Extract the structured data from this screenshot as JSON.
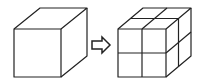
{
  "diagram": {
    "left": {
      "label": "single-cube"
    },
    "arrow": {
      "label": "transforms-to",
      "direction": "right"
    },
    "right": {
      "label": "cube-2x2x2",
      "divisions": 2
    },
    "colors": {
      "stroke": "#222222",
      "background": "#ffffff",
      "arrow_fill": "#ffffff"
    }
  }
}
